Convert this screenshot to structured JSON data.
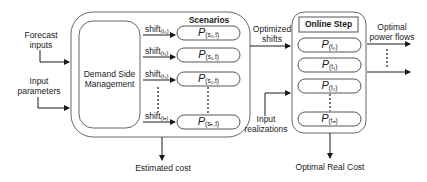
{
  "diagram": {
    "inputs": {
      "forecast_inputs": [
        "Forecast",
        "inputs"
      ],
      "input_parameters": [
        "Input",
        "parameters"
      ]
    },
    "dsm": {
      "label_line1": "Demand Side",
      "label_line2": "Management"
    },
    "scenarios": {
      "title": "Scenarios",
      "rows": [
        {
          "shift_base": "shift",
          "shift_sub": "t₀",
          "p_base": "P",
          "p_sub": "s₀,t"
        },
        {
          "shift_base": "shift",
          "shift_sub": "t₁",
          "p_base": "P",
          "p_sub": "s₁,t"
        },
        {
          "shift_base": "shift",
          "shift_sub": "t₂",
          "p_base": "P",
          "p_sub": "s₂,t"
        },
        {
          "shift_base": "shift",
          "shift_sub": "tₙ",
          "p_base": "P",
          "p_sub": "sₙ,t"
        }
      ]
    },
    "estimated_cost": "Estimated cost",
    "optimized_shifts": [
      "Optimized",
      "shifts"
    ],
    "online_step": {
      "title": "Online Step",
      "rows": [
        {
          "p_base": "P",
          "p_sub": "t₀"
        },
        {
          "p_base": "P",
          "p_sub": "t₁"
        },
        {
          "p_base": "P",
          "p_sub": "t₂"
        },
        {
          "p_base": "P",
          "p_sub": "tₙ"
        }
      ]
    },
    "input_realizations": [
      "Input",
      "realizations"
    ],
    "optimal_power_flows": [
      "Optimal",
      "power flows"
    ],
    "optimal_real_cost": "Optimal Real Cost",
    "colors": {
      "stroke": "#1a1a1a",
      "box_stroke": "#555555",
      "background": "#ffffff"
    }
  }
}
